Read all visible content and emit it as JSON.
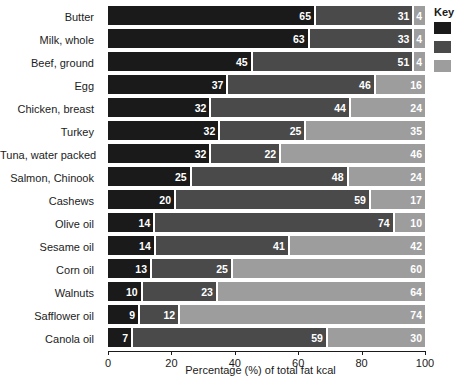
{
  "chart_data": {
    "type": "bar",
    "subtype": "horizontal-stacked-100",
    "title": "",
    "xlabel": "Percentage (%) of total fat kcal",
    "ylabel": "",
    "xlim": [
      0,
      100
    ],
    "xticks": [
      0,
      20,
      40,
      60,
      80,
      100
    ],
    "grid": false,
    "legend_position": "right",
    "categories": [
      "Butter",
      "Milk, whole",
      "Beef, ground",
      "Egg",
      "Chicken, breast",
      "Turkey",
      "Tuna, water packed",
      "Salmon, Chinook",
      "Cashews",
      "Olive oil",
      "Sesame oil",
      "Corn oil",
      "Walnuts",
      "Safflower oil",
      "Canola oil"
    ],
    "series": [
      {
        "name": "Saturated",
        "color": "#1a1a1a",
        "values": [
          65,
          63,
          45,
          37,
          32,
          32,
          32,
          25,
          20,
          14,
          14,
          13,
          10,
          9,
          7
        ]
      },
      {
        "name": "Monounsaturated",
        "color": "#4a4a4a",
        "values": [
          31,
          33,
          51,
          46,
          44,
          25,
          22,
          48,
          59,
          74,
          41,
          25,
          23,
          12,
          59
        ]
      },
      {
        "name": "Polyunsaturated",
        "color": "#9d9d9d",
        "values": [
          4,
          4,
          4,
          16,
          24,
          35,
          46,
          24,
          17,
          10,
          42,
          60,
          64,
          74,
          30
        ]
      }
    ]
  },
  "axis": {
    "x_title": "Percentage (%) of total fat kcal",
    "tick_labels": [
      "0",
      "20",
      "40",
      "60",
      "80",
      "100"
    ]
  },
  "legend": {
    "title": "Key",
    "items": [
      {
        "label": "",
        "color": "#1a1a1a",
        "swatch_name": "legend-swatch-saturated"
      },
      {
        "label": "",
        "color": "#4a4a4a",
        "swatch_name": "legend-swatch-monounsaturated"
      },
      {
        "label": "",
        "color": "#9d9d9d",
        "swatch_name": "legend-swatch-polyunsaturated"
      }
    ]
  }
}
